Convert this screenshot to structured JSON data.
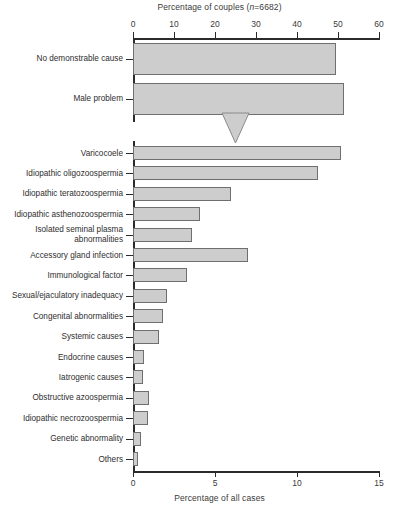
{
  "chart_data": {
    "type": "bar",
    "orientation": "horizontal",
    "title": "",
    "top_axis": {
      "label_prefix": "Percentage of couples (",
      "label_italic": "n",
      "label_suffix": "=6682)",
      "label_full": "Percentage of couples (n=6682)",
      "ticks": [
        0,
        10,
        20,
        30,
        40,
        50,
        60
      ],
      "xlim": [
        0,
        60
      ]
    },
    "bottom_axis": {
      "label": "Percentage of all cases",
      "ticks": [
        0,
        5,
        10,
        15
      ],
      "xlim": [
        0,
        15
      ]
    },
    "panels": [
      {
        "name": "couples-panel",
        "axis": "top",
        "categories": [
          "No demonstrable cause",
          "Male problem"
        ],
        "values": [
          49.5,
          51.5
        ]
      },
      {
        "name": "male-causes-panel",
        "axis": "bottom",
        "categories": [
          "Varicocoele",
          "Idiopathic oligozoospermia",
          "Idiopathic teratozoospermia",
          "Idiopathic asthenozoospermia",
          "Isolated seminal plasma\nabnormalities",
          "Accessory gland infection",
          "Immunological factor",
          "Sexual/ejaculatory inadequacy",
          "Congenital abnormalities",
          "Systemic causes",
          "Endocrine causes",
          "Iatrogenic causes",
          "Obstructive azoospermia",
          "Idiopathic necrozoospermia",
          "Genetic abnormality",
          "Others"
        ],
        "values": [
          12.7,
          11.3,
          6.0,
          4.1,
          3.6,
          7.0,
          3.3,
          2.1,
          1.8,
          1.6,
          0.7,
          0.6,
          1.0,
          0.9,
          0.5,
          0.3
        ]
      }
    ],
    "annotation": {
      "type": "down-triangle-marker",
      "points_to": "Male problem",
      "value_position": 24.8
    },
    "colors": {
      "bar_fill": "#cdcdcd",
      "bar_stroke": "#6f6f6f",
      "axis": "#2b2b2b",
      "text": "#2e2e2e",
      "background": "#ffffff"
    },
    "grid": false,
    "legend": null
  }
}
